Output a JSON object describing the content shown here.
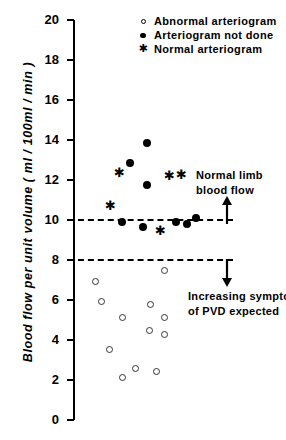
{
  "chart_data": {
    "type": "scatter",
    "title": "",
    "xlabel": "",
    "ylabel": "Blood flow per unit volume  ( ml / 100ml / min )",
    "ylim": [
      0,
      20
    ],
    "ytick_labels": [
      "20",
      "18",
      "16",
      "14",
      "12",
      "10",
      "8",
      "6",
      "4",
      "2",
      "0"
    ],
    "yticks": [
      20,
      18,
      16,
      14,
      12,
      10,
      8,
      6,
      4,
      2,
      0
    ],
    "xlim": [
      0,
      10
    ],
    "xaxis_visible": false,
    "grid": false,
    "legend_position": "top-right",
    "series": [
      {
        "name": "Abnormal arteriogram",
        "marker": "open-circle",
        "points": [
          {
            "x": 4.6,
            "y": 7.45
          },
          {
            "x": 1.15,
            "y": 6.9
          },
          {
            "x": 1.45,
            "y": 5.9
          },
          {
            "x": 3.9,
            "y": 5.75
          },
          {
            "x": 2.5,
            "y": 5.1
          },
          {
            "x": 4.6,
            "y": 5.1
          },
          {
            "x": 3.85,
            "y": 4.45
          },
          {
            "x": 4.6,
            "y": 4.25
          },
          {
            "x": 1.85,
            "y": 3.5
          },
          {
            "x": 3.15,
            "y": 2.55
          },
          {
            "x": 4.2,
            "y": 2.4
          },
          {
            "x": 2.5,
            "y": 2.1
          }
        ]
      },
      {
        "name": "Arteriogram not done",
        "marker": "filled-circle",
        "points": [
          {
            "x": 3.7,
            "y": 13.85
          },
          {
            "x": 2.85,
            "y": 12.85
          },
          {
            "x": 3.7,
            "y": 11.75
          },
          {
            "x": 2.45,
            "y": 9.9
          },
          {
            "x": 3.5,
            "y": 9.65
          },
          {
            "x": 5.15,
            "y": 9.9
          },
          {
            "x": 5.7,
            "y": 9.8
          },
          {
            "x": 6.15,
            "y": 10.1
          }
        ]
      },
      {
        "name": "Normal arteriogram",
        "marker": "star",
        "points": [
          {
            "x": 2.3,
            "y": 12.4
          },
          {
            "x": 4.8,
            "y": 12.25
          },
          {
            "x": 5.4,
            "y": 12.3
          },
          {
            "x": 1.85,
            "y": 10.75
          },
          {
            "x": 4.35,
            "y": 9.5
          }
        ]
      }
    ],
    "reference_lines": [
      {
        "y": 10,
        "style": "dashed",
        "label": "normal-limb-threshold"
      },
      {
        "y": 8,
        "style": "dashed",
        "label": "pvd-threshold"
      }
    ],
    "annotations": [
      {
        "name": "normal-limb-blood-flow",
        "lines": [
          "Normal  limb",
          "blood  flow"
        ],
        "arrow": "up",
        "y": 10
      },
      {
        "name": "increasing-symptoms-pvd",
        "lines": [
          "Increasing  symptoms",
          "of  PVD  expected"
        ],
        "arrow": "down",
        "y": 8
      }
    ]
  },
  "legend": {
    "items": [
      {
        "marker": "open-circle",
        "label": "Abnormal  arteriogram"
      },
      {
        "marker": "filled-circle",
        "label": "Arteriogram  not  done"
      },
      {
        "marker": "star",
        "label": "Normal  arteriogram"
      }
    ]
  },
  "axis": {
    "y_title": "Blood  flow  per  unit  volume   ( ml / 100ml / min )"
  },
  "annotation_text": {
    "normal_limb_line1": "Normal  limb",
    "normal_limb_line2": "blood  flow",
    "pvd_line1": "Increasing  symptoms",
    "pvd_line2": "of  PVD  expected"
  },
  "colors": {
    "axis": "#000000",
    "marker_filled": "#000000",
    "marker_open_stroke": "#333333",
    "reference_line": "#000000"
  },
  "star_glyph": "✱"
}
